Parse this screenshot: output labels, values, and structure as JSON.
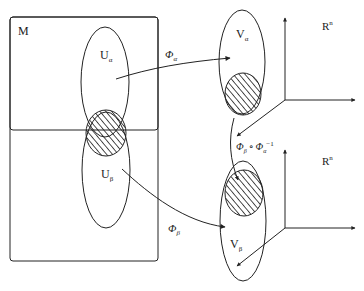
{
  "diagram": {
    "manifold_label": "M",
    "sets": {
      "u_alpha": {
        "base": "U",
        "sub": "α"
      },
      "u_beta": {
        "base": "U",
        "sub": "β"
      },
      "v_alpha": {
        "base": "V",
        "sub": "α"
      },
      "v_beta": {
        "base": "V",
        "sub": "β"
      }
    },
    "maps": {
      "phi_alpha": {
        "base": "Φ",
        "sub": "α"
      },
      "phi_beta": {
        "base": "Φ",
        "sub": "β"
      },
      "transition": {
        "a": "Φ",
        "a_sub": "β",
        "op": "∘",
        "b": "Φ",
        "b_sub": "α",
        "sup": "−1"
      }
    },
    "spaces": {
      "top": {
        "base": "R",
        "sup": "n"
      },
      "bottom": {
        "base": "R",
        "sup": "n"
      }
    },
    "colors": {
      "stroke": "#222222",
      "background": "#ffffff"
    }
  }
}
